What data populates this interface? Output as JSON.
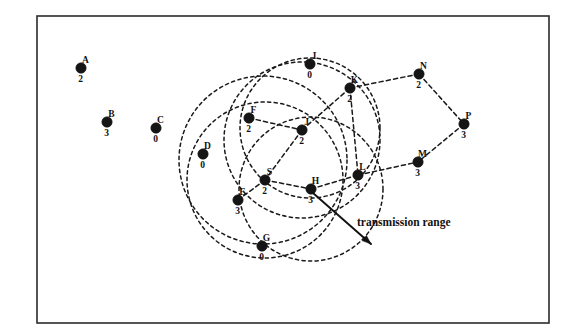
{
  "figure": {
    "title": "",
    "background_color": "#ffffff",
    "frame": {
      "x": 37,
      "y": 16,
      "width": 512,
      "height": 307,
      "stroke_color": "#2b2b2b"
    }
  },
  "annotation": {
    "label": "transmission range",
    "text_x": 357,
    "text_y": 226,
    "pointer_from": {
      "x": 313,
      "y": 193
    },
    "pointer_to": {
      "x": 371,
      "y": 244
    }
  },
  "nodes": [
    {
      "id": "A",
      "value": "2",
      "x": 81,
      "y": 68,
      "r": 5.2
    },
    {
      "id": "B",
      "value": "3",
      "x": 107,
      "y": 122,
      "r": 5.2
    },
    {
      "id": "C",
      "value": "0",
      "x": 156,
      "y": 128,
      "r": 5.2
    },
    {
      "id": "D",
      "value": "0",
      "x": 203,
      "y": 154,
      "r": 5.2
    },
    {
      "id": "F",
      "value": "2",
      "x": 249,
      "y": 118,
      "r": 5.2
    },
    {
      "id": "I",
      "value": "0",
      "x": 310,
      "y": 64,
      "r": 5.2
    },
    {
      "id": "K",
      "value": "2",
      "x": 350,
      "y": 88,
      "r": 5.2
    },
    {
      "id": "N",
      "value": "2",
      "x": 419,
      "y": 74,
      "r": 5.2
    },
    {
      "id": "P",
      "value": "3",
      "x": 464,
      "y": 124,
      "r": 5.2
    },
    {
      "id": "J",
      "value": "2",
      "x": 302,
      "y": 130,
      "r": 5.2
    },
    {
      "id": "M",
      "value": "3",
      "x": 418,
      "y": 162,
      "r": 5.2
    },
    {
      "id": "S",
      "value": "2",
      "x": 265,
      "y": 180,
      "r": 5.2
    },
    {
      "id": "H",
      "value": "3",
      "x": 311,
      "y": 189,
      "r": 5.2
    },
    {
      "id": "L",
      "value": "3",
      "x": 358,
      "y": 175,
      "r": 5.2
    },
    {
      "id": "E",
      "value": "3",
      "x": 238,
      "y": 200,
      "r": 5.2
    },
    {
      "id": "G",
      "value": "0",
      "x": 262,
      "y": 246,
      "r": 5.2
    }
  ],
  "edges": [
    {
      "from": "F",
      "to": "J"
    },
    {
      "from": "J",
      "to": "S"
    },
    {
      "from": "J",
      "to": "K"
    },
    {
      "from": "S",
      "to": "H"
    },
    {
      "from": "S",
      "to": "E"
    },
    {
      "from": "H",
      "to": "L"
    },
    {
      "from": "L",
      "to": "M"
    },
    {
      "from": "K",
      "to": "N"
    },
    {
      "from": "N",
      "to": "P"
    },
    {
      "from": "P",
      "to": "M"
    },
    {
      "from": "K",
      "to": "L"
    }
  ],
  "range_circles": [
    {
      "cx": 310,
      "cy": 128,
      "r": 70
    },
    {
      "cx": 302,
      "cy": 140,
      "r": 78
    },
    {
      "cx": 265,
      "cy": 180,
      "r": 78
    },
    {
      "cx": 311,
      "cy": 189,
      "r": 72
    },
    {
      "cx": 263,
      "cy": 160,
      "r": 84
    }
  ],
  "chart_data": {
    "type": "scatter",
    "title": "",
    "xlabel": "",
    "ylabel": "",
    "categories": [
      "A",
      "B",
      "C",
      "D",
      "F",
      "I",
      "K",
      "N",
      "P",
      "J",
      "M",
      "S",
      "H",
      "L",
      "E",
      "G"
    ],
    "values": [
      2,
      3,
      0,
      0,
      2,
      0,
      2,
      2,
      3,
      2,
      3,
      2,
      3,
      3,
      3,
      0
    ],
    "series": [
      {
        "name": "node value",
        "values": [
          2,
          3,
          0,
          0,
          2,
          0,
          2,
          2,
          3,
          2,
          3,
          2,
          3,
          3,
          3,
          0
        ]
      }
    ],
    "x": [
      81,
      107,
      156,
      203,
      249,
      310,
      350,
      419,
      464,
      302,
      418,
      265,
      311,
      358,
      238,
      262
    ],
    "y": [
      68,
      122,
      128,
      154,
      118,
      64,
      88,
      74,
      124,
      130,
      162,
      180,
      189,
      175,
      200,
      246
    ],
    "grid": false,
    "legend_position": "none",
    "annotations": [
      "transmission range"
    ]
  }
}
